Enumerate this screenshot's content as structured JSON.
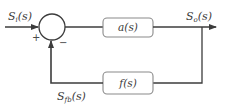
{
  "diagram": {
    "type": "feedback-block-diagram",
    "input_signal": {
      "main": "S",
      "sub": "i",
      "arg": "(s)"
    },
    "output_signal": {
      "main": "S",
      "sub": "o",
      "arg": "(s)"
    },
    "feedback_signal": {
      "main": "S",
      "sub": "fb",
      "arg": "(s)"
    },
    "summing_junction": {
      "plus_sign": "+",
      "minus_sign": "−"
    },
    "forward_block": {
      "label": "a(s)"
    },
    "feedback_block": {
      "label": "f(s)"
    },
    "colors": {
      "line": "#3c3c3c",
      "block_border": "#8a8a8a",
      "text": "#3a3a3a"
    }
  }
}
